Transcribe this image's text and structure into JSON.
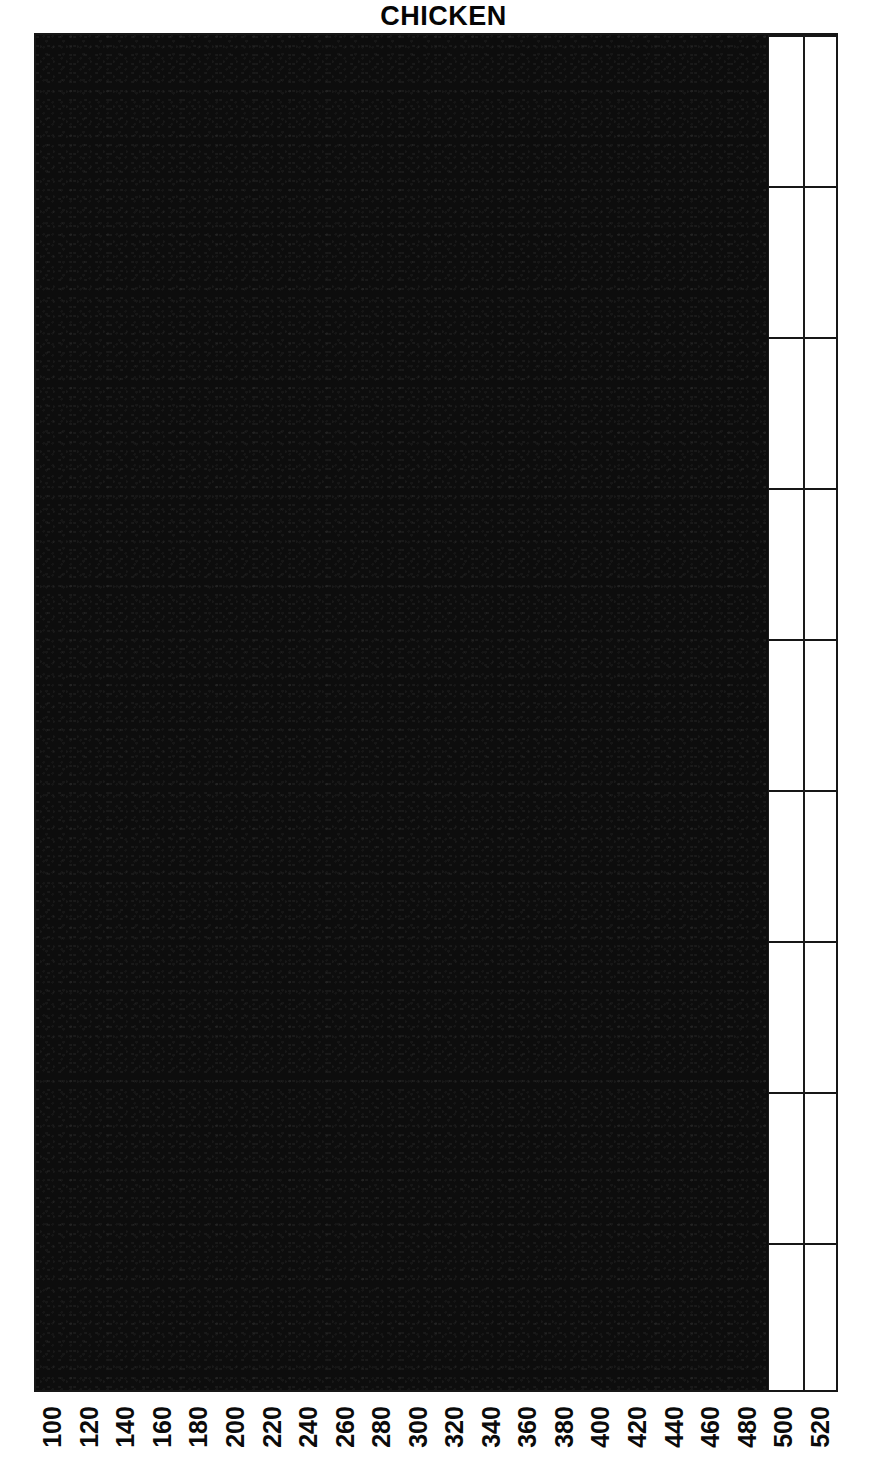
{
  "chart_data": {
    "type": "bar",
    "title": "CHICKEN",
    "orientation": "vertical",
    "xlabel": "",
    "ylabel": "",
    "grid": true,
    "legend": false,
    "legend_position": "none",
    "categories": [
      "100",
      "120",
      "140",
      "160",
      "180",
      "200",
      "220",
      "240",
      "260",
      "280",
      "300",
      "320",
      "340",
      "360",
      "380",
      "400",
      "420",
      "440",
      "460",
      "480",
      "500",
      "520"
    ],
    "values": [
      9,
      9,
      9,
      9,
      9,
      9,
      9,
      9,
      9,
      9,
      9,
      9,
      9,
      9,
      9,
      9,
      9,
      9,
      9,
      9,
      0,
      0
    ],
    "ylim": [
      0,
      9
    ],
    "y_gridline_count": 9,
    "bar_color": "#0d0d0d",
    "axis_color": "#161616",
    "background_color": "#ffffff"
  },
  "figure": {
    "title": "CHICKEN",
    "clipped_y_axis_label": "|"
  },
  "axes": {
    "x_tick_labels": [
      "100",
      "120",
      "140",
      "160",
      "180",
      "200",
      "220",
      "240",
      "260",
      "280",
      "300",
      "320",
      "340",
      "360",
      "380",
      "400",
      "420",
      "440",
      "460",
      "480",
      "500",
      "520"
    ],
    "x_tick_count": 22,
    "y_gridline_positions": [
      0,
      1,
      2,
      3,
      4,
      5,
      6,
      7,
      8,
      9
    ]
  }
}
